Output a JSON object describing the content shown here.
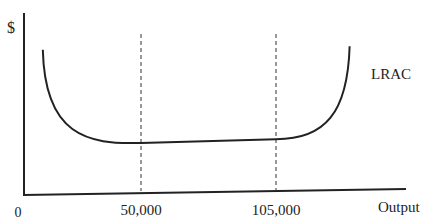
{
  "chart_data": {
    "type": "line",
    "title": "",
    "ylabel": "$",
    "xlabel": "Output",
    "origin_label": "0",
    "x_ticks": [
      {
        "value": 50000,
        "label": "50,000"
      },
      {
        "value": 105000,
        "label": "105,000"
      }
    ],
    "series": [
      {
        "name": "LRAC",
        "shape": "U-shaped with flat bottom between 50,000 and 105,000",
        "points": [
          {
            "x": 10000,
            "y": 0.8
          },
          {
            "x": 30000,
            "y": 0.38
          },
          {
            "x": 50000,
            "y": 0.28
          },
          {
            "x": 105000,
            "y": 0.3
          },
          {
            "x": 125000,
            "y": 0.42
          },
          {
            "x": 135000,
            "y": 0.82
          }
        ]
      }
    ],
    "reference_lines": [
      {
        "axis": "x",
        "value": 50000,
        "style": "dashed"
      },
      {
        "axis": "x",
        "value": 105000,
        "style": "dashed"
      }
    ],
    "xlim": [
      0,
      150000
    ],
    "ylim": [
      0,
      1
    ],
    "grid": false,
    "legend": "none (curve labeled directly at right end)"
  }
}
